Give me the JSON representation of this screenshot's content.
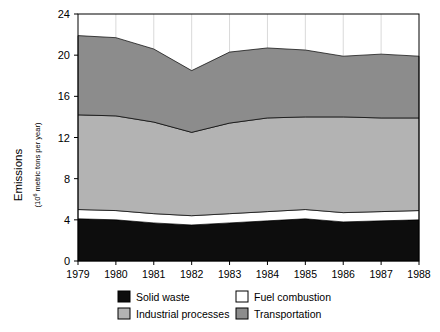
{
  "chart_data": {
    "type": "area",
    "stacked": true,
    "title": "",
    "xlabel": "",
    "ylabel": "Emissions",
    "ylabel_sub": "(10⁶ metric tons per year)",
    "ylabel_sub_prefix": "(10",
    "ylabel_sub_exponent": "6",
    "ylabel_sub_suffix": " metric tons per year)",
    "x": [
      1979,
      1980,
      1981,
      1982,
      1983,
      1984,
      1985,
      1986,
      1987,
      1988
    ],
    "categories": [
      "1979",
      "1980",
      "1981",
      "1982",
      "1983",
      "1984",
      "1985",
      "1986",
      "1987",
      "1988"
    ],
    "xlim": [
      1979,
      1988
    ],
    "ylim": [
      0,
      24
    ],
    "yticks": [
      0,
      4,
      8,
      12,
      16,
      20,
      24
    ],
    "ytick_labels": [
      "0",
      "4",
      "8",
      "12",
      "16",
      "20",
      "24"
    ],
    "grid": "vertical",
    "legend_position": "bottom",
    "series": [
      {
        "name": "Solid waste",
        "color": "#0d0d0d",
        "values": [
          4.1,
          4.0,
          3.7,
          3.5,
          3.7,
          3.9,
          4.1,
          3.8,
          3.9,
          4.0
        ]
      },
      {
        "name": "Fuel combustion",
        "color": "#ffffff",
        "values": [
          0.9,
          0.9,
          0.9,
          0.9,
          0.9,
          0.9,
          0.9,
          0.9,
          0.9,
          0.9
        ]
      },
      {
        "name": "Industrial processes",
        "color": "#b3b3b3",
        "values": [
          9.2,
          9.2,
          8.9,
          8.1,
          8.8,
          9.1,
          9.0,
          9.3,
          9.1,
          9.0
        ]
      },
      {
        "name": "Transportation",
        "color": "#8c8c8c",
        "values": [
          7.7,
          7.6,
          7.1,
          6.0,
          6.9,
          6.8,
          6.5,
          5.9,
          6.2,
          6.0
        ]
      }
    ],
    "cumulative_tops": {
      "solid_waste": [
        4.1,
        4.0,
        3.7,
        3.5,
        3.7,
        3.9,
        4.1,
        3.8,
        3.9,
        4.0
      ],
      "fuel_combustion": [
        5.0,
        4.9,
        4.6,
        4.4,
        4.6,
        4.8,
        5.0,
        4.7,
        4.8,
        4.9
      ],
      "industrial_processes": [
        14.2,
        14.1,
        13.5,
        12.5,
        13.4,
        13.9,
        14.0,
        14.0,
        13.9,
        13.9
      ],
      "transportation": [
        21.9,
        21.7,
        20.6,
        18.5,
        20.3,
        20.7,
        20.5,
        19.9,
        20.1,
        19.9
      ]
    }
  },
  "legend": {
    "items": [
      {
        "label": "Solid waste",
        "color": "#0d0d0d",
        "border": "#000000"
      },
      {
        "label": "Fuel combustion",
        "color": "#ffffff",
        "border": "#000000"
      },
      {
        "label": "Industrial processes",
        "color": "#b3b3b3",
        "border": "#000000"
      },
      {
        "label": "Transportation",
        "color": "#8c8c8c",
        "border": "#000000"
      }
    ]
  },
  "axes": {
    "y_title": "Emissions",
    "frame_color": "#000000",
    "gridline_color": "#d9d9d9"
  }
}
